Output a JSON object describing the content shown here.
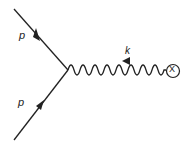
{
  "diagram": {
    "type": "feynman",
    "labels": {
      "incoming_top": "p",
      "incoming_bottom": "p",
      "photon": "k",
      "vertex_end": "X"
    },
    "colors": {
      "stroke": "#222222",
      "background": "#ffffff"
    }
  }
}
